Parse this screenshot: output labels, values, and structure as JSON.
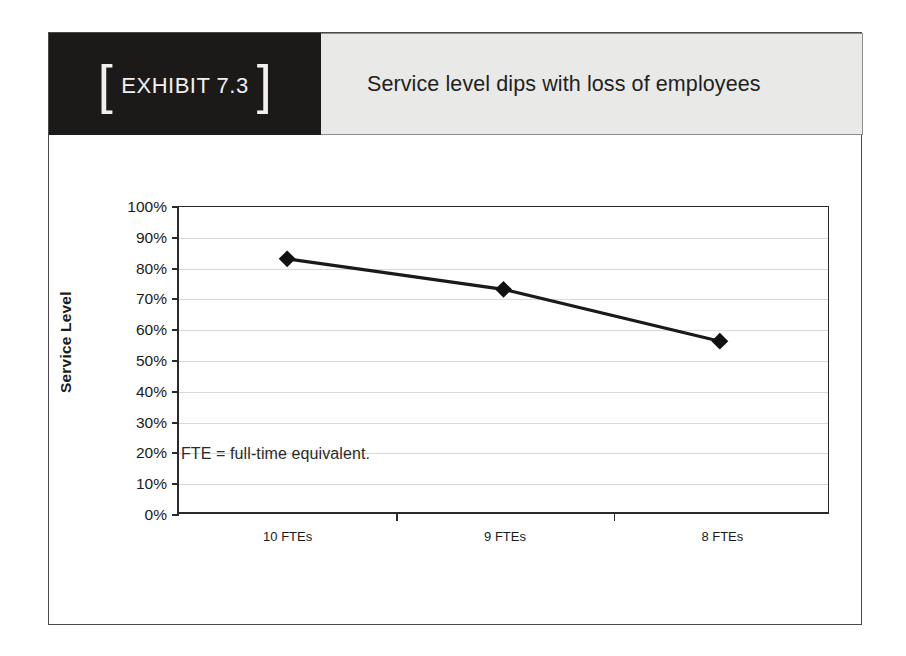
{
  "exhibit": {
    "tag_bracket_left": "[",
    "tag_label": "EXHIBIT 7.3",
    "tag_bracket_right": "]",
    "title": "Service level dips with loss of employees",
    "footnote": "FTE = full-time equivalent."
  },
  "colors": {
    "tag_background": "#1c1a19",
    "tag_text": "#f2f0ee",
    "title_background": "#e9e9e7",
    "title_text": "#221f1f",
    "frame_border": "#4a4a4a",
    "axis": "#2a2a2a",
    "gridline": "#d8d8d8",
    "series_line": "#1a1a1a",
    "series_marker": "#111111"
  },
  "chart_data": {
    "type": "line",
    "title": "Service level dips with loss of employees",
    "xlabel": "",
    "ylabel": "Service Level",
    "categories": [
      "10 FTEs",
      "9 FTEs",
      "8 FTEs"
    ],
    "values": [
      83,
      73,
      56
    ],
    "series": [
      {
        "name": "Service Level",
        "values": [
          83,
          73,
          56
        ]
      }
    ],
    "ylim": [
      0,
      100
    ],
    "ytick_values": [
      0,
      10,
      20,
      30,
      40,
      50,
      60,
      70,
      80,
      90,
      100
    ],
    "ytick_labels": [
      "0%",
      "10%",
      "20%",
      "30%",
      "40%",
      "50%",
      "60%",
      "70%",
      "80%",
      "90%",
      "100%"
    ],
    "value_suffix": "%",
    "grid": true,
    "grid_axis": "y",
    "legend": false,
    "legend_position": "none",
    "marker": "diamond",
    "annotations": [
      "FTE = full-time equivalent."
    ]
  }
}
